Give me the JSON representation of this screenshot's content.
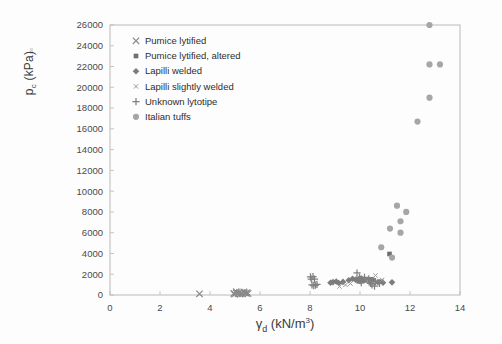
{
  "chart_data": {
    "type": "scatter",
    "title": "",
    "xlabel": "γd (kN/m3)",
    "xlabel_base": "γ",
    "xlabel_sub": "d",
    "xlabel_unit": " (kN/m",
    "xlabel_sup": "3",
    "xlabel_close": ")",
    "ylabel_base": "p",
    "ylabel_sub": "c",
    "ylabel_unit": " (kPa)",
    "xlim": [
      0,
      14
    ],
    "ylim": [
      0,
      26000
    ],
    "xticks": [
      0,
      2,
      4,
      6,
      8,
      10,
      12,
      14
    ],
    "yticks": [
      0,
      2000,
      4000,
      6000,
      8000,
      10000,
      12000,
      14000,
      16000,
      18000,
      20000,
      22000,
      24000,
      26000
    ],
    "grid": false,
    "legend_position": "top-left-inside",
    "series": [
      {
        "name": "Pumice lytified",
        "marker": "x",
        "color": "#8a8a8a",
        "points": [
          [
            3.58,
            120
          ],
          [
            4.95,
            150
          ],
          [
            5.05,
            200
          ],
          [
            5.12,
            140
          ],
          [
            5.18,
            260
          ],
          [
            5.25,
            180
          ],
          [
            5.3,
            120
          ],
          [
            5.38,
            210
          ],
          [
            5.45,
            160
          ],
          [
            5.52,
            130
          ],
          [
            5.05,
            320
          ],
          [
            5.2,
            90
          ],
          [
            5.35,
            300
          ],
          [
            5.48,
            240
          ],
          [
            4.98,
            80
          ]
        ]
      },
      {
        "name": "Pumice lytified, altered",
        "marker": "square",
        "color": "#6e6e6e",
        "points": [
          [
            11.18,
            3950
          ],
          [
            10.42,
            1500
          ],
          [
            9.95,
            1320
          ],
          [
            10.85,
            1280
          ]
        ]
      },
      {
        "name": "Lapilli welded",
        "marker": "diamond",
        "color": "#7c7c7c",
        "points": [
          [
            9.05,
            1300
          ],
          [
            9.15,
            1150
          ],
          [
            9.32,
            1260
          ],
          [
            9.55,
            1420
          ],
          [
            9.7,
            1560
          ],
          [
            9.82,
            1480
          ],
          [
            9.95,
            1520
          ],
          [
            10.05,
            1600
          ],
          [
            10.12,
            1380
          ],
          [
            10.25,
            1440
          ],
          [
            10.38,
            1300
          ],
          [
            10.52,
            1460
          ],
          [
            10.72,
            1240
          ],
          [
            10.92,
            1180
          ],
          [
            11.28,
            1220
          ],
          [
            8.82,
            1180
          ],
          [
            8.92,
            1240
          ],
          [
            10.0,
            1350
          ],
          [
            10.18,
            1500
          ]
        ]
      },
      {
        "name": "Lapilli slightly welded",
        "marker": "x-small",
        "color": "#9a9a9a",
        "points": [
          [
            9.18,
            820
          ],
          [
            9.42,
            980
          ],
          [
            10.62,
            1880
          ],
          [
            10.88,
            1460
          ],
          [
            9.62,
            1100
          ],
          [
            10.3,
            1340
          ]
        ]
      },
      {
        "name": "Unknown lytotipe",
        "marker": "plus",
        "color": "#808080",
        "points": [
          [
            8.02,
            1740
          ],
          [
            8.05,
            1540
          ],
          [
            8.12,
            1760
          ],
          [
            8.18,
            1520
          ],
          [
            8.08,
            980
          ],
          [
            8.15,
            900
          ],
          [
            8.22,
            960
          ],
          [
            8.28,
            1020
          ],
          [
            9.88,
            2120
          ],
          [
            10.18,
            1700
          ],
          [
            10.35,
            1560
          ],
          [
            10.42,
            1120
          ],
          [
            10.48,
            980
          ],
          [
            10.58,
            860
          ],
          [
            10.78,
            1120
          ],
          [
            10.05,
            1180
          ],
          [
            9.98,
            1720
          ],
          [
            10.62,
            1280
          ]
        ]
      },
      {
        "name": "Italian tuffs",
        "marker": "circle",
        "color": "#a6a6a6",
        "points": [
          [
            12.78,
            26000
          ],
          [
            12.78,
            22200
          ],
          [
            13.2,
            22200
          ],
          [
            12.78,
            19000
          ],
          [
            12.3,
            16700
          ],
          [
            11.48,
            8600
          ],
          [
            11.85,
            8000
          ],
          [
            11.62,
            7100
          ],
          [
            11.2,
            6400
          ],
          [
            11.62,
            6000
          ],
          [
            10.85,
            4600
          ],
          [
            11.28,
            3600
          ]
        ]
      }
    ]
  },
  "legend": {
    "items": [
      {
        "label": "Pumice lytified",
        "marker": "x"
      },
      {
        "label": "Pumice lytified, altered",
        "marker": "square"
      },
      {
        "label": "Lapilli welded",
        "marker": "diamond"
      },
      {
        "label": "Lapilli slightly welded",
        "marker": "x-small"
      },
      {
        "label": "Unknown lytotipe",
        "marker": "plus"
      },
      {
        "label": "Italian tuffs",
        "marker": "circle"
      }
    ]
  }
}
